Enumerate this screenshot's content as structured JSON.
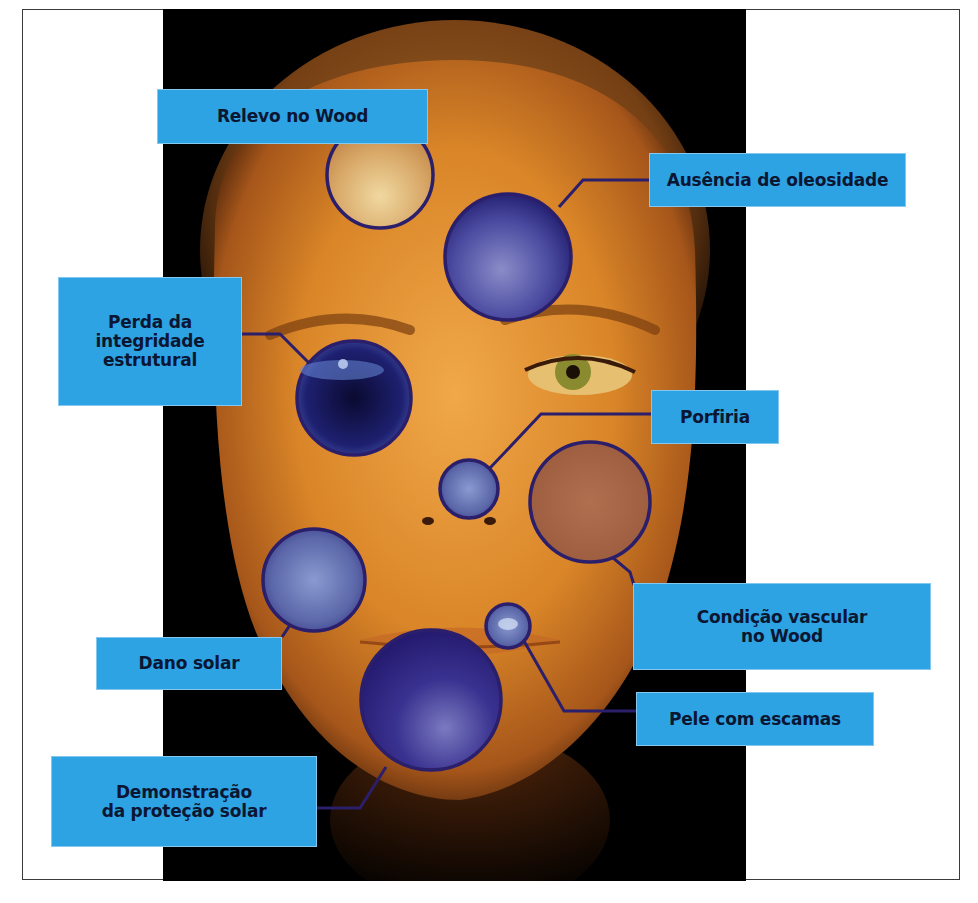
{
  "figure": {
    "colors": {
      "label_bg": "#2ea3e3",
      "label_text": "#0b1633",
      "ring": "#2b1f6b",
      "background": "#000000",
      "skin": "#d9892c"
    }
  },
  "annotations": [
    {
      "id": "relevo",
      "text": "Relevo no Wood"
    },
    {
      "id": "oleosidade",
      "text": "Ausência de oleosidade"
    },
    {
      "id": "integridade",
      "lines": [
        "Perda da",
        "integridade",
        "estrutural"
      ]
    },
    {
      "id": "porfiria",
      "text": "Porfiria"
    },
    {
      "id": "vascular",
      "lines": [
        "Condição vascular",
        "no Wood"
      ]
    },
    {
      "id": "dano",
      "text": "Dano solar"
    },
    {
      "id": "escamas",
      "text": "Pele com escamas"
    },
    {
      "id": "protecao",
      "lines": [
        "Demonstração",
        "da proteção solar"
      ]
    }
  ]
}
